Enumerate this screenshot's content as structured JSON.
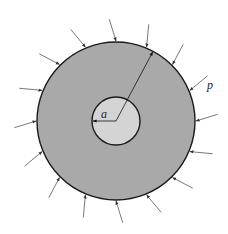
{
  "diagram": {
    "center": [
      116,
      121
    ],
    "outer_circle": {
      "radius": 79,
      "fill": "#a9a9a9",
      "stroke": "#1a1a1a"
    },
    "inner_circle": {
      "radius": 24,
      "fill": "#d4d4d4",
      "stroke": "#1a1a1a"
    },
    "labels": {
      "inner_radius": "a",
      "pressure": "p"
    },
    "pressure_arrows": {
      "count": 16,
      "length": 22,
      "color": "#555555"
    },
    "radius_line_angle_deg": -62
  }
}
